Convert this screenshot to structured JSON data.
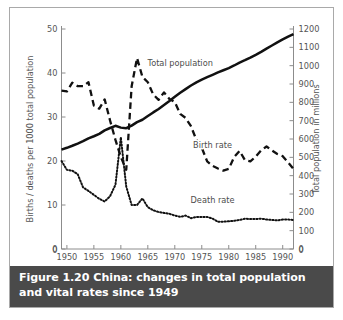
{
  "figure": {
    "caption_label": "Figure 1.20",
    "caption_title": "China: changes in total population and vital rates since 1949"
  },
  "chart_data": {
    "type": "line",
    "title": "China: changes in total population and vital rates since 1949",
    "xlabel": "",
    "ylabel": "Births / deaths per 1000 total population",
    "y2label": "Total population in millions",
    "xlim": [
      1949,
      1992
    ],
    "ylim": [
      0,
      50
    ],
    "y2lim": [
      0,
      1200
    ],
    "xticks": [
      1950,
      1955,
      1960,
      1965,
      1970,
      1975,
      1980,
      1985,
      1990
    ],
    "xticklabels": [
      "1950",
      "1955",
      "1960",
      "1965",
      "1970",
      "1975",
      "1980",
      "1985",
      "1990"
    ],
    "yticks": [
      0,
      10,
      20,
      30,
      40,
      50
    ],
    "yticklabels": [
      "0",
      "10",
      "20",
      "30",
      "40",
      "50"
    ],
    "y2ticks": [
      0,
      100,
      200,
      300,
      400,
      500,
      600,
      700,
      800,
      900,
      1000,
      1100,
      1200
    ],
    "y2ticklabels": [
      "0",
      "100",
      "200",
      "300",
      "400",
      "500",
      "600",
      "700",
      "800",
      "900",
      "1000",
      "1100",
      "1200"
    ],
    "grid": false,
    "legend_position": "inline-annotations",
    "series": [
      {
        "name": "Total population",
        "axis": "right",
        "style": "solid",
        "color": "#111111",
        "label_x": 1971,
        "label_y": 1000,
        "x": [
          1949,
          1950,
          1951,
          1952,
          1953,
          1954,
          1955,
          1956,
          1957,
          1958,
          1959,
          1960,
          1961,
          1962,
          1963,
          1964,
          1965,
          1966,
          1967,
          1968,
          1969,
          1970,
          1971,
          1972,
          1973,
          1974,
          1975,
          1976,
          1977,
          1978,
          1979,
          1980,
          1981,
          1982,
          1983,
          1984,
          1985,
          1986,
          1987,
          1988,
          1989,
          1990,
          1991,
          1992
        ],
        "values": [
          542,
          552,
          563,
          575,
          588,
          603,
          615,
          628,
          647,
          660,
          672,
          662,
          659,
          673,
          692,
          705,
          725,
          745,
          764,
          785,
          807,
          830,
          852,
          872,
          892,
          909,
          924,
          937,
          950,
          963,
          975,
          987,
          1001,
          1017,
          1030,
          1044,
          1059,
          1075,
          1093,
          1110,
          1127,
          1143,
          1158,
          1172
        ]
      },
      {
        "name": "Birth rate",
        "axis": "left",
        "style": "dashed",
        "color": "#111111",
        "label_x": 1977,
        "label_y": 23,
        "x": [
          1949,
          1950,
          1951,
          1952,
          1953,
          1954,
          1955,
          1956,
          1957,
          1958,
          1959,
          1960,
          1961,
          1962,
          1963,
          1964,
          1965,
          1966,
          1967,
          1968,
          1969,
          1970,
          1971,
          1972,
          1973,
          1974,
          1975,
          1976,
          1977,
          1978,
          1979,
          1980,
          1981,
          1982,
          1983,
          1984,
          1985,
          1986,
          1987,
          1988,
          1989,
          1990,
          1991,
          1992
        ],
        "values": [
          36.0,
          35.8,
          37.8,
          37.0,
          37.0,
          37.9,
          32.6,
          31.9,
          34.0,
          29.2,
          24.8,
          20.9,
          18.0,
          37.0,
          43.4,
          39.1,
          37.9,
          35.1,
          33.9,
          35.6,
          34.1,
          33.4,
          30.7,
          29.8,
          27.9,
          24.8,
          23.0,
          19.9,
          18.9,
          18.3,
          17.8,
          18.2,
          20.9,
          22.3,
          20.2,
          19.9,
          21.0,
          22.4,
          23.3,
          22.4,
          21.6,
          21.1,
          19.7,
          18.2
        ]
      },
      {
        "name": "Death rate",
        "axis": "left",
        "style": "dotted",
        "color": "#111111",
        "label_x": 1977,
        "label_y": 10.5,
        "x": [
          1949,
          1950,
          1951,
          1952,
          1953,
          1954,
          1955,
          1956,
          1957,
          1958,
          1959,
          1960,
          1961,
          1962,
          1963,
          1964,
          1965,
          1966,
          1967,
          1968,
          1969,
          1970,
          1971,
          1972,
          1973,
          1974,
          1975,
          1976,
          1977,
          1978,
          1979,
          1980,
          1981,
          1982,
          1983,
          1984,
          1985,
          1986,
          1987,
          1988,
          1989,
          1990,
          1991,
          1992
        ],
        "values": [
          20.0,
          18.0,
          17.8,
          17.0,
          14.0,
          13.2,
          12.3,
          11.4,
          10.8,
          12.0,
          14.6,
          25.4,
          14.2,
          10.0,
          10.0,
          11.5,
          9.5,
          8.8,
          8.4,
          8.2,
          8.0,
          7.6,
          7.3,
          7.6,
          7.0,
          7.3,
          7.3,
          7.3,
          6.9,
          6.2,
          6.2,
          6.3,
          6.4,
          6.6,
          6.9,
          6.8,
          6.8,
          6.9,
          6.7,
          6.6,
          6.5,
          6.7,
          6.7,
          6.6
        ]
      }
    ]
  },
  "axes": {
    "left_title": "Births / deaths per 1000 total population",
    "right_title": "Total population in millions"
  }
}
